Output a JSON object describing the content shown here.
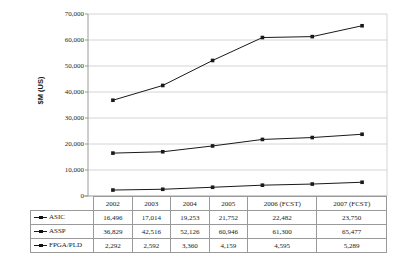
{
  "chart_data": {
    "type": "line",
    "title": "",
    "xlabel": "",
    "ylabel": "$M (US)",
    "ylim": [
      0,
      70000
    ],
    "ytick_step": 10000,
    "grid": true,
    "legend_position": "table-below",
    "categories": [
      "2002",
      "2003",
      "2004",
      "2005",
      "2006 (FCST)",
      "2007 (FCST)"
    ],
    "series": [
      {
        "name": "ASIC",
        "values": [
          16496,
          17014,
          19253,
          21752,
          22482,
          23750
        ],
        "labels": [
          "16,496",
          "17,014",
          "19,253",
          "21,752",
          "22,482",
          "23,750"
        ],
        "color": "#1a1a1a",
        "marker": "square"
      },
      {
        "name": "ASSP",
        "values": [
          36829,
          42516,
          52126,
          60946,
          61300,
          65477
        ],
        "labels": [
          "36,829",
          "42,516",
          "52,126",
          "60,946",
          "61,300",
          "65,477"
        ],
        "color": "#1a1a1a",
        "marker": "square"
      },
      {
        "name": "FPGA/PLD",
        "values": [
          2292,
          2592,
          3360,
          4159,
          4595,
          5289
        ],
        "labels": [
          "2,292",
          "2,592",
          "3,360",
          "4,159",
          "4,595",
          "5,289"
        ],
        "color": "#1a1a1a",
        "marker": "square"
      }
    ],
    "ytick_labels": [
      "70,000",
      "60,000",
      "50,000",
      "40,000",
      "30,000",
      "20,000",
      "10,000",
      "0"
    ],
    "ytick_values": [
      70000,
      60000,
      50000,
      40000,
      30000,
      20000,
      10000,
      0
    ]
  },
  "colors": {
    "line": "#1a1a1a",
    "grid": "#c9c9c9",
    "axis": "#9a9a9a",
    "table_border": "#9a9a9a",
    "background": "#ffffff"
  }
}
